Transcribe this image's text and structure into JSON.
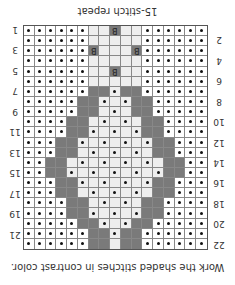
{
  "title": "15-stitch repeat",
  "caption": "Work the shaded stitches in contrast color.",
  "columns": 17,
  "rows": 22,
  "colors": {
    "band": "#7a7a7a",
    "light": "#eeeeee",
    "dot": "#111111",
    "grid": "#888888"
  },
  "legend": {
    "dot": "purl-dot",
    "bobble_label": "B",
    "shaded": "contrast color"
  },
  "row_labels_left": [
    "1",
    "3",
    "5",
    "7",
    "9",
    "11",
    "13",
    "15",
    "17",
    "19",
    "21"
  ],
  "row_labels_right": [
    "2",
    "4",
    "6",
    "8",
    "10",
    "12",
    "14",
    "16",
    "18",
    "20",
    "22"
  ],
  "bobbles": [
    {
      "row": 1,
      "col": 9
    },
    {
      "row": 3,
      "col": 7
    },
    {
      "row": 3,
      "col": 11
    },
    {
      "row": 5,
      "col": 9
    }
  ],
  "band": [
    {
      "row": 7,
      "left": [
        7,
        8
      ],
      "right": [
        10,
        11
      ]
    },
    {
      "row": 8,
      "left": [
        6,
        7
      ],
      "right": [
        11,
        12
      ]
    },
    {
      "row": 9,
      "left": [
        6,
        7
      ],
      "right": [
        11,
        12
      ]
    },
    {
      "row": 10,
      "left": [
        5,
        6
      ],
      "right": [
        12,
        13
      ]
    },
    {
      "row": 11,
      "left": [
        5,
        6
      ],
      "right": [
        12,
        13
      ]
    },
    {
      "row": 12,
      "left": [
        4,
        5
      ],
      "right": [
        13,
        14
      ]
    },
    {
      "row": 13,
      "left": [
        4,
        5
      ],
      "right": [
        13,
        14
      ]
    },
    {
      "row": 14,
      "left": [
        3,
        4
      ],
      "right": [
        14,
        15
      ]
    },
    {
      "row": 15,
      "left": [
        3,
        4
      ],
      "right": [
        14,
        15
      ]
    },
    {
      "row": 16,
      "left": [
        4,
        5
      ],
      "right": [
        13,
        14
      ]
    },
    {
      "row": 17,
      "left": [
        4,
        5
      ],
      "right": [
        13,
        14
      ]
    },
    {
      "row": 18,
      "left": [
        5,
        6
      ],
      "right": [
        12,
        13
      ]
    },
    {
      "row": 19,
      "left": [
        5,
        6
      ],
      "right": [
        12,
        13
      ]
    },
    {
      "row": 20,
      "left": [
        6,
        7
      ],
      "right": [
        11,
        12
      ]
    },
    {
      "row": 21,
      "left": [
        7,
        8
      ],
      "right": [
        10,
        11
      ]
    },
    {
      "row": 22,
      "left": [
        7,
        8
      ],
      "right": [
        10,
        11
      ]
    }
  ]
}
